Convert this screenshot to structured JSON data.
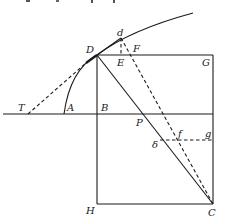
{
  "figure": {
    "type": "geometric construction diagram",
    "points": {
      "T": {
        "label": "T",
        "x": 28,
        "y": 114
      },
      "A": {
        "label": "A",
        "x": 64,
        "y": 114
      },
      "B": {
        "label": "B",
        "x": 97,
        "y": 114
      },
      "D": {
        "label": "D",
        "x": 97,
        "y": 55
      },
      "d": {
        "label": "d",
        "x": 121,
        "y": 38
      },
      "E": {
        "label": "E",
        "x": 121,
        "y": 55
      },
      "F": {
        "label": "F",
        "x": 131,
        "y": 55
      },
      "G": {
        "label": "G",
        "x": 213,
        "y": 55
      },
      "P": {
        "label": "P",
        "x": 137,
        "y": 114
      },
      "f": {
        "label": "f",
        "x": 177,
        "y": 140
      },
      "g": {
        "label": "g",
        "x": 213,
        "y": 140
      },
      "delta": {
        "label": "δ",
        "x": 160,
        "y": 140
      },
      "H": {
        "label": "H",
        "x": 97,
        "y": 204
      },
      "C": {
        "label": "C",
        "x": 213,
        "y": 204
      }
    },
    "colors": {
      "ink": "#1a1a1a",
      "background": "#ffffff"
    }
  }
}
